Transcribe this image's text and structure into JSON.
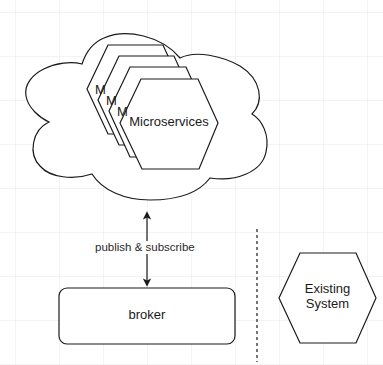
{
  "diagram": {
    "type": "architecture",
    "colors": {
      "background": "#ffffff",
      "grid": "#e6e6e6",
      "stroke": "#1a1a1a",
      "text": "#1a1a1a"
    },
    "cloud": {
      "label": ""
    },
    "microservices": {
      "front_label": "Microservices",
      "stacked_labels": [
        "M",
        "M",
        "M"
      ]
    },
    "connector": {
      "label": "publish & subscribe",
      "direction": "bidirectional"
    },
    "broker": {
      "label": "broker"
    },
    "separator": {
      "style": "dashed"
    },
    "existing_system": {
      "line1": "Existing",
      "line2": "System"
    }
  }
}
